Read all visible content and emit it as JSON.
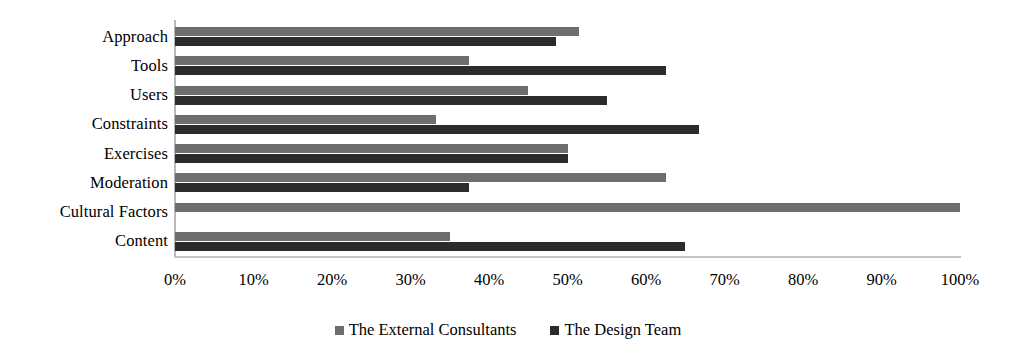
{
  "chart_data": {
    "type": "bar",
    "orientation": "horizontal",
    "title": "",
    "xlabel": "",
    "ylabel": "",
    "xlim": [
      0,
      100
    ],
    "xtick_labels": [
      "0%",
      "10%",
      "20%",
      "30%",
      "40%",
      "50%",
      "60%",
      "70%",
      "80%",
      "90%",
      "100%"
    ],
    "xticks": [
      0,
      10,
      20,
      30,
      40,
      50,
      60,
      70,
      80,
      90,
      100
    ],
    "grid": false,
    "legend_position": "bottom",
    "categories": [
      "Approach",
      "Tools",
      "Users",
      "Constraints",
      "Exercises",
      "Moderation",
      "Cultural Factors",
      "Content"
    ],
    "series": [
      {
        "name": "The External Consultants",
        "color": "#6e6e6e",
        "values": [
          51.5,
          37.5,
          45,
          33.3,
          50,
          62.5,
          100,
          35
        ]
      },
      {
        "name": "The Design Team",
        "color": "#2b2b2b",
        "values": [
          48.5,
          62.5,
          55,
          66.7,
          50,
          37.5,
          0,
          65
        ]
      }
    ]
  },
  "legend": {
    "items": [
      {
        "label": "The External Consultants",
        "swatch": "legend-swatch-external"
      },
      {
        "label": "The Design Team",
        "swatch": "legend-swatch-design"
      }
    ]
  }
}
